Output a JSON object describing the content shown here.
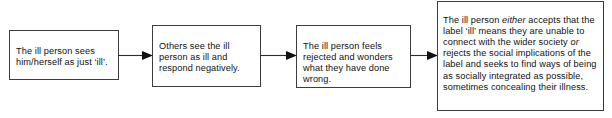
{
  "diagram": {
    "type": "flowchart",
    "orientation": "left-to-right",
    "title": "",
    "background_color": "#ffffff",
    "box_border_color": "#3d3d3d",
    "text_color": "#111111",
    "arrow_color": "#111111",
    "nodes": [
      {
        "id": "node-1",
        "name": "self-perception",
        "text": "The ill person sees him/herself as just ‘ill’.",
        "lines": [
          "The ill person",
          "sees him/herself",
          "as just ‘ill’."
        ]
      },
      {
        "id": "node-2",
        "name": "others-reaction",
        "text": "Others see the ill person as ill and respond negatively.",
        "lines": [
          "Others see the ill",
          "person as ill and",
          "respond",
          "negatively."
        ]
      },
      {
        "id": "node-3",
        "name": "rejection-feeling",
        "text": "The ill person feels rejected and wonders what they have done wrong.",
        "lines": [
          "The ill person",
          "feels rejected and",
          "wonders what they",
          "have done wrong."
        ]
      },
      {
        "id": "node-4",
        "name": "acceptance-or-rejection",
        "text_parts": [
          {
            "text": "The ill person ",
            "style": "normal"
          },
          {
            "text": "either",
            "style": "italic"
          },
          {
            "text": " accepts that the label ‘ill’ means they are unable to connect with the wider society ",
            "style": "normal"
          },
          {
            "text": "or",
            "style": "italic"
          },
          {
            "text": " rejects the social implications of the label and seeks to find ways of being as socially integrated as possible, sometimes concealing their illness.",
            "style": "normal"
          }
        ],
        "text": "The ill person either accepts that the label ‘ill’ means they are unable to connect with the wider society or rejects the social implications of the label and seeks to find ways of being as socially integrated as possible, sometimes concealing their illness."
      }
    ],
    "arrows": [
      {
        "id": "arrow-1",
        "name": "arrow-node1-to-node2",
        "from": "node-1",
        "to": "node-2",
        "direction": "right"
      },
      {
        "id": "arrow-2",
        "name": "arrow-node2-to-node3",
        "from": "node-2",
        "to": "node-3",
        "direction": "right"
      },
      {
        "id": "arrow-3",
        "name": "arrow-node3-to-node4",
        "from": "node-3",
        "to": "node-4",
        "direction": "right"
      }
    ]
  }
}
